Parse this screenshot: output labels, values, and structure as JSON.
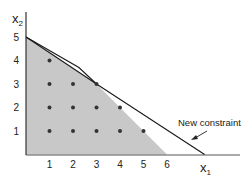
{
  "diagram": {
    "type": "integer-programming-feasible-region",
    "axes": {
      "x_label": "x",
      "x_sub": "1",
      "y_label": "x",
      "y_sub": "2",
      "x_ticks": [
        "1",
        "2",
        "3",
        "4",
        "5",
        "6"
      ],
      "y_ticks": [
        "1",
        "2",
        "3",
        "4",
        "5"
      ]
    },
    "feasible_region": {
      "fill": "#c8c8c8",
      "vertices": [
        [
          0,
          0
        ],
        [
          0,
          5
        ],
        [
          3,
          3
        ],
        [
          6,
          0
        ]
      ]
    },
    "original_constraint_line": {
      "points": [
        [
          0,
          5
        ],
        [
          2.25,
          3.7
        ],
        [
          3,
          3
        ]
      ]
    },
    "new_constraint_line": {
      "points": [
        [
          0,
          5
        ],
        [
          3,
          3
        ],
        [
          7.6,
          0
        ]
      ]
    },
    "integer_points": [
      [
        1,
        4
      ],
      [
        1,
        3
      ],
      [
        2,
        3
      ],
      [
        3,
        3
      ],
      [
        1,
        2
      ],
      [
        2,
        2
      ],
      [
        3,
        2
      ],
      [
        4,
        2
      ],
      [
        1,
        1
      ],
      [
        2,
        1
      ],
      [
        3,
        1
      ],
      [
        4,
        1
      ],
      [
        5,
        1
      ]
    ],
    "annotation": {
      "text": "New constraint"
    },
    "colors": {
      "line": "#1a1a1a",
      "dot": "#333333",
      "region": "#c8c8c8",
      "axis": "#333333"
    }
  }
}
